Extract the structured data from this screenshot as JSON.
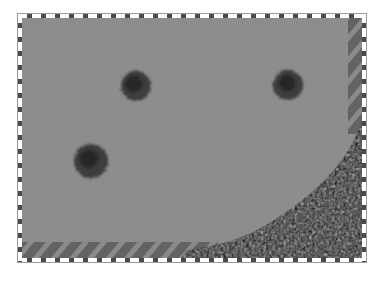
{
  "scene": {
    "view": "top-down map",
    "colors": {
      "background": "#ffffff",
      "field": "#8f8f8f",
      "field_light": "#979797",
      "tree_dark": "#3a3a3a",
      "tree_mid": "#555555",
      "forest_dark": "#1e1e1e",
      "forest_light": "#7a7a7a",
      "hatch_dark": "#5e5e5e",
      "hatch_light": "#8a8a8a",
      "border_dash_dark": "#4a4a4a",
      "border_dash_light": "#ffffff"
    },
    "frame": {
      "x": 17,
      "y": 13,
      "width": 350,
      "height": 250
    },
    "trees": [
      {
        "id": "tree-1",
        "cx": 135,
        "cy": 85,
        "r": 16
      },
      {
        "id": "tree-2",
        "cx": 287,
        "cy": 84,
        "r": 16
      },
      {
        "id": "tree-3",
        "cx": 90,
        "cy": 160,
        "r": 18
      }
    ],
    "forest": {
      "corner": "bottom-right"
    },
    "boundary_bands": [
      "right-edge",
      "bottom-edge"
    ]
  }
}
